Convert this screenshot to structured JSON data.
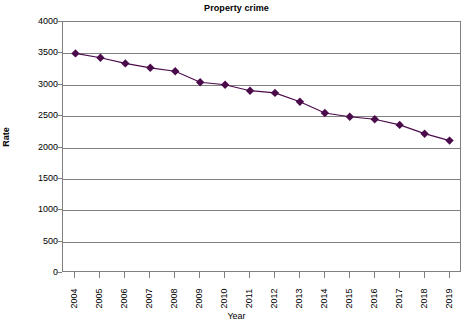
{
  "chart_data": {
    "type": "line",
    "title": "Property crime",
    "xlabel": "Year",
    "ylabel": "Rate",
    "categories": [
      "2004",
      "2005",
      "2006",
      "2007",
      "2008",
      "2009",
      "2010",
      "2011",
      "2012",
      "2013",
      "2014",
      "2015",
      "2016",
      "2017",
      "2018",
      "2019"
    ],
    "values": [
      3500,
      3430,
      3340,
      3270,
      3215,
      3040,
      3000,
      2905,
      2870,
      2730,
      2550,
      2490,
      2450,
      2360,
      2220,
      2110
    ],
    "series": [
      {
        "name": "Property crime",
        "values": [
          3500,
          3430,
          3340,
          3270,
          3215,
          3040,
          3000,
          2905,
          2870,
          2730,
          2550,
          2490,
          2450,
          2360,
          2220,
          2110
        ]
      }
    ],
    "ylim": [
      0,
      4000
    ],
    "yticks": [
      0,
      500,
      1000,
      1500,
      2000,
      2500,
      3000,
      3500,
      4000
    ],
    "ytick_labels": [
      "0",
      "500",
      "1000",
      "1500",
      "2000",
      "2500",
      "3000",
      "3500",
      "4000"
    ],
    "grid": true,
    "legend": false,
    "legend_position": "none",
    "marker": "diamond",
    "series_color": "#4b0b4b",
    "line_color": "#4b0b4b",
    "grid_color": "#808080",
    "axis_color": "#808080",
    "background_color": "#ffffff",
    "text_color": "#000000"
  }
}
